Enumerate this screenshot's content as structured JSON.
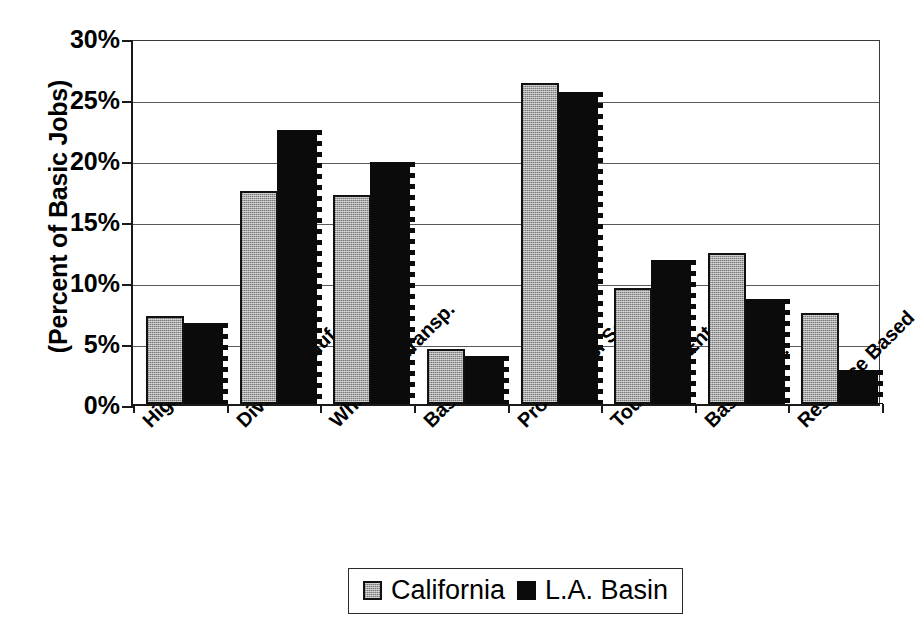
{
  "chart_data": {
    "type": "bar",
    "title": "",
    "xlabel": "",
    "ylabel": "(Percent of Basic Jobs)",
    "ylim": [
      0,
      30
    ],
    "ytick_labels": [
      "30%",
      "25%",
      "20%",
      "15%",
      "10%",
      "5%",
      "0%"
    ],
    "ytick_values": [
      30,
      25,
      20,
      15,
      10,
      5,
      0
    ],
    "grid": true,
    "legend_position": "bottom",
    "categories": [
      "High Tech",
      "Divers. Manuf.",
      "Whsl Tr & Transp.",
      "Basic Info.",
      "Prof. & Bus. Serv.",
      "Tourism & Ent",
      "Basic Govt.",
      "Resource Based"
    ],
    "series": [
      {
        "name": "California",
        "color": "#a6a6a6",
        "values": [
          7.2,
          17.5,
          17.1,
          4.5,
          26.3,
          9.5,
          12.4,
          7.5
        ]
      },
      {
        "name": "L.A. Basin",
        "color": "#0b0b0b",
        "values": [
          6.6,
          22.5,
          19.8,
          3.9,
          25.6,
          11.8,
          8.6,
          2.8
        ]
      }
    ]
  },
  "legend": {
    "entries": [
      {
        "label": "California",
        "swatch": "gray-swatch-icon"
      },
      {
        "label": "L.A. Basin",
        "swatch": "black-swatch-icon"
      }
    ]
  }
}
